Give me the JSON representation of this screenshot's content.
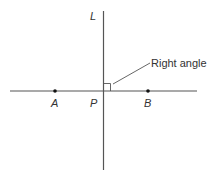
{
  "diagram": {
    "type": "geometry",
    "labels": {
      "line": "L",
      "point_a": "A",
      "point_p": "P",
      "point_b": "B",
      "annotation": "Right angle"
    },
    "colors": {
      "line": "#555555",
      "text": "#333333",
      "point": "#111111"
    }
  }
}
